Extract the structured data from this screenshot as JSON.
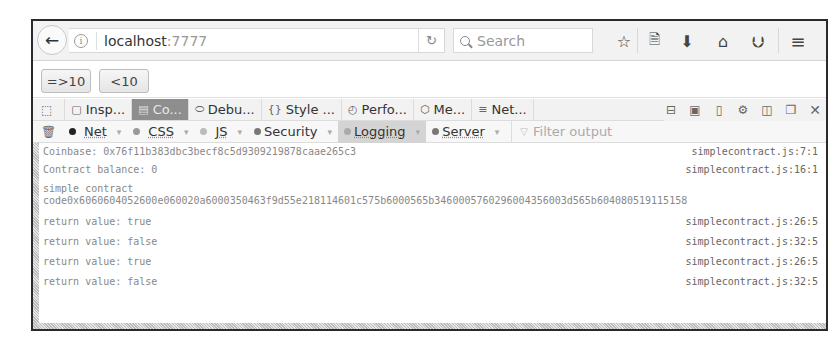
{
  "browser": {
    "url_host": "localhost",
    "url_port": ":7777",
    "search_placeholder": "Search",
    "icons": [
      "back-arrow-icon",
      "info-icon",
      "reload-icon",
      "search-icon",
      "bookmark-star-icon",
      "reading-list-icon",
      "download-icon",
      "home-icon",
      "pocket-icon",
      "menu-icon"
    ]
  },
  "page": {
    "buttons": [
      {
        "label": "=>10"
      },
      {
        "label": "<10"
      }
    ]
  },
  "devtools": {
    "tabs": [
      {
        "label": "Insp...",
        "icon": "inspector-icon"
      },
      {
        "label": "Co...",
        "icon": "console-icon",
        "active": true
      },
      {
        "label": "Debu...",
        "icon": "debugger-icon"
      },
      {
        "label": "Style ...",
        "icon": "style-editor-icon"
      },
      {
        "label": "Perfo...",
        "icon": "performance-icon"
      },
      {
        "label": "Me...",
        "icon": "memory-icon"
      },
      {
        "label": "Net...",
        "icon": "network-icon"
      }
    ],
    "filters": [
      {
        "label": "Net",
        "dot": "#222222"
      },
      {
        "label": "CSS",
        "dot": "#999999"
      },
      {
        "label": "JS",
        "dot": "#bbbbbb"
      },
      {
        "label": "Security",
        "dot": "#777777"
      },
      {
        "label": "Logging",
        "dot": "#aaaaaa",
        "active": true
      },
      {
        "label": "Server",
        "dot": "#777777"
      }
    ],
    "filter_placeholder": "Filter output",
    "logs": [
      {
        "message": "Coinbase: 0x76f11b383dbc3becf8c5d9309219878caae265c3",
        "source": "simplecontract.js:7:1"
      },
      {
        "message": "Contract balance: 0",
        "source": "simplecontract.js:16:1"
      },
      {
        "message": "simple contract\ncode0x6060604052600e060020a6000350463f9d55e218114601c575b6000565b3460005760296004356003d565b604080519115158",
        "source": ""
      },
      {
        "message": "return value: true",
        "source": "simplecontract.js:26:5"
      },
      {
        "message": "return value: false",
        "source": "simplecontract.js:32:5"
      },
      {
        "message": "return value: true",
        "source": "simplecontract.js:26:5"
      },
      {
        "message": "return value: false",
        "source": "simplecontract.js:32:5"
      }
    ]
  }
}
